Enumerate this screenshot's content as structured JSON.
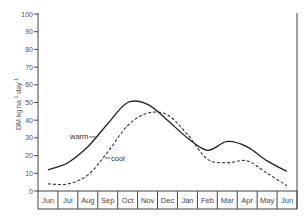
{
  "chart_data": {
    "type": "line",
    "title": "",
    "xlabel": "",
    "ylabel": "DM kg ha⁻¹ day⁻¹",
    "ylim": [
      0,
      100
    ],
    "yticks": [
      0,
      10,
      20,
      30,
      40,
      50,
      60,
      70,
      80,
      90,
      100
    ],
    "grid": false,
    "legend": "inline labels with leader lines",
    "categories": [
      "Jun",
      "Jul",
      "Aug",
      "Sep",
      "Oct",
      "Nov",
      "Dec",
      "Jan",
      "Feb",
      "Mar",
      "Apr",
      "May",
      "Jun"
    ],
    "series": [
      {
        "name": "warm",
        "style": "solid",
        "values": [
          12,
          16,
          25,
          38,
          50,
          49,
          40,
          30,
          23,
          28,
          25,
          17,
          11
        ]
      },
      {
        "name": "cool",
        "style": "dashed",
        "values": [
          4,
          4,
          9,
          22,
          37,
          44,
          43,
          32,
          18,
          16,
          17,
          10,
          3
        ]
      }
    ]
  },
  "labels": {
    "warm": "warm",
    "cool": "cool",
    "y_axis_main": "DM kg ha",
    "y_axis_sup1": "-1",
    "y_axis_day": " day",
    "y_axis_sup2": "-1"
  },
  "colors": {
    "line": "#222222",
    "axis": "#444444"
  }
}
